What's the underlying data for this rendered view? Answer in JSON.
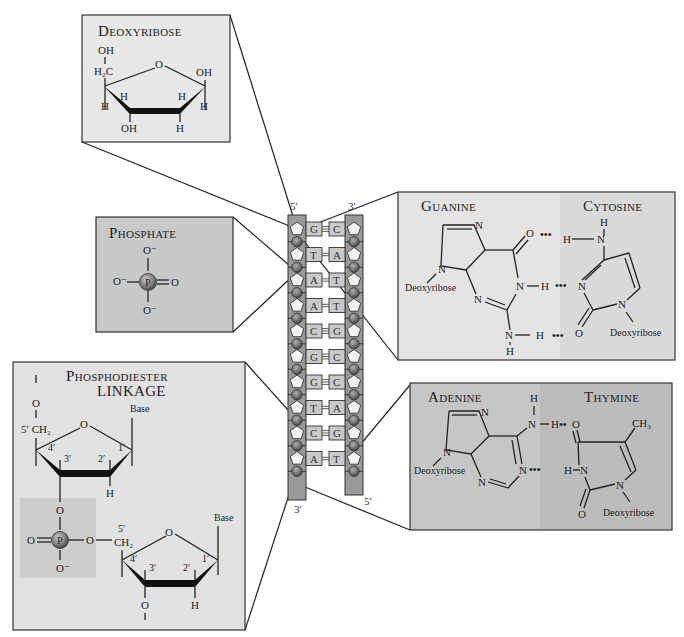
{
  "panels": {
    "deoxyribose": {
      "title_big": "D",
      "title_small": "EOXYRIBOSE",
      "labels": {
        "oh_top": "OH",
        "h2c": "H₂C",
        "o_ring": "O",
        "oh_right": "OH",
        "h_c4_up": "H",
        "h_c1_low": "H",
        "h_c3_up": "H",
        "h_c2_up": "H",
        "h_c1_down": "H",
        "oh_bottom": "OH",
        "h_bottom": "H",
        "h_left_bottom": "H"
      }
    },
    "phosphate": {
      "title_big": "P",
      "title_small": "HOSPHATE",
      "labels": {
        "o_top": "O⁻",
        "o_left": "O⁻",
        "p": "P",
        "o_right": "O",
        "o_bottom": "O⁻"
      }
    },
    "phosphodiester": {
      "title_line1_big": "P",
      "title_line1_small": "HOSPHODIESTER",
      "title_line2": "LINKAGE",
      "labels": {
        "o_top": "O",
        "c5_ch2": "5′ CH₂",
        "ring_o": "O",
        "base1": "Base",
        "c4": "4′",
        "c3": "3′",
        "c2": "2′",
        "c1": "1′",
        "h1": "H",
        "o_link": "O",
        "o_double": "O",
        "p": "P",
        "o_ester": "O",
        "c5b": "5′",
        "ch2b": "CH₂",
        "o_minus": "O⁻",
        "ring_o2": "O",
        "base2": "Base",
        "c4b": "4′",
        "c3b": "3′",
        "c2b": "2′",
        "c1b": "1′",
        "o_bottom": "O",
        "h2": "H"
      }
    },
    "guanine_cytosine": {
      "guanine_title_big": "G",
      "guanine_title_small": "UANINE",
      "cytosine_title_big": "C",
      "cytosine_title_small": "YTOSINE",
      "labels": {
        "n7": "N",
        "n9": "N",
        "deoxy_g": "Deoxyribose",
        "o6": "O",
        "n1": "N",
        "h1": "H",
        "n3": "N",
        "n2": "N",
        "h2a": "H",
        "h2b": "H",
        "c_h_top": "H",
        "c_n4": "N",
        "c_h4": "H",
        "c_n3": "N",
        "c_o2": "O",
        "c_n1": "N",
        "deoxy_c": "Deoxyribose",
        "hbond1": "•••",
        "hbond2": "•••",
        "hbond3": "•••"
      }
    },
    "adenine_thymine": {
      "adenine_title_big": "A",
      "adenine_title_small": "DENINE",
      "thymine_title_big": "T",
      "thymine_title_small": "HYMINE",
      "labels": {
        "n7": "N",
        "n9": "N",
        "deoxy_a": "Deoxyribose",
        "h_top": "H",
        "n6": "N",
        "h6": "H",
        "n1": "N",
        "n3": "N",
        "t_o4": "O",
        "t_ch3": "CH₃",
        "t_h3": "H",
        "t_n3": "N",
        "t_o2": "O",
        "t_n1": "N",
        "deoxy_t": "Deoxyribose",
        "hbond1": "••",
        "hbond2": "•••"
      }
    }
  },
  "helix": {
    "left_top_label": "5′",
    "right_top_label": "3′",
    "left_bottom_label": "3′",
    "right_bottom_label": "5′",
    "pairs": [
      {
        "left": "G",
        "right": "C",
        "bonds": 3
      },
      {
        "left": "T",
        "right": "A",
        "bonds": 2
      },
      {
        "left": "A",
        "right": "T",
        "bonds": 2
      },
      {
        "left": "A",
        "right": "T",
        "bonds": 2
      },
      {
        "left": "C",
        "right": "G",
        "bonds": 3
      },
      {
        "left": "G",
        "right": "C",
        "bonds": 3
      },
      {
        "left": "G",
        "right": "C",
        "bonds": 3
      },
      {
        "left": "T",
        "right": "A",
        "bonds": 2
      },
      {
        "left": "C",
        "right": "G",
        "bonds": 3
      },
      {
        "left": "A",
        "right": "T",
        "bonds": 2
      }
    ]
  },
  "colors": {
    "panel_light": "#e6e6e6",
    "panel_mid": "#c8c8c8",
    "panel_dark": "#bdbdbd",
    "strand": "#9a9a9a",
    "base_box": "#c9c9c9",
    "phosphate_ball": "#6a6a6a",
    "sugar_pentagon": "#f4f4f4"
  }
}
